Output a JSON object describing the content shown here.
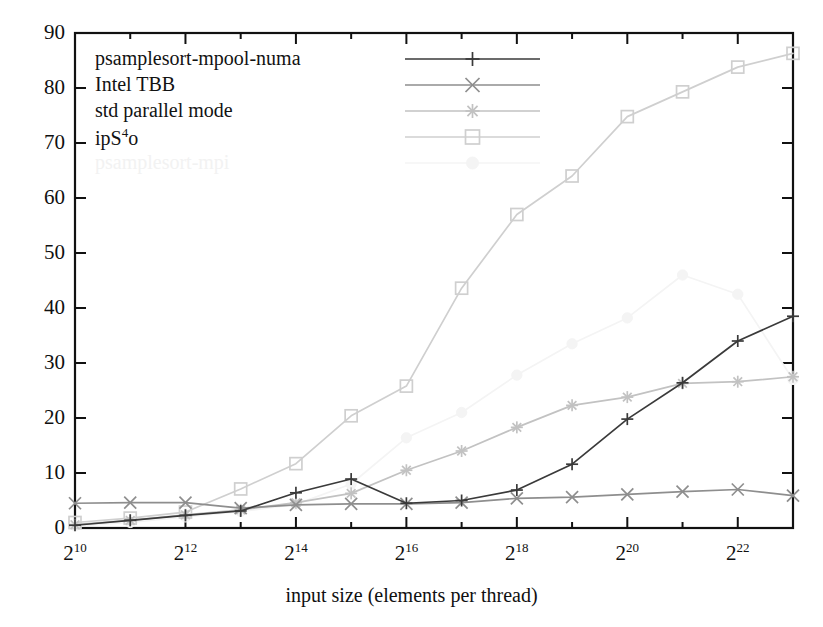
{
  "chart_data": {
    "type": "line",
    "title": "",
    "xlabel": "input size (elements per thread)",
    "ylabel": "",
    "x_tick_labels": [
      "2^10",
      "2^12",
      "2^14",
      "2^16",
      "2^18",
      "2^20",
      "2^22"
    ],
    "x_exponents": [
      10,
      11,
      12,
      13,
      14,
      15,
      16,
      17,
      18,
      19,
      20,
      21,
      22,
      23
    ],
    "x_labeled_exponents": [
      10,
      12,
      14,
      16,
      18,
      20,
      22
    ],
    "xlim_exponents": [
      10,
      23
    ],
    "y_ticks": [
      0,
      10,
      20,
      30,
      40,
      50,
      60,
      70,
      80,
      90
    ],
    "ylim": [
      0,
      90
    ],
    "grid": false,
    "legend_position": "top-left-inside",
    "series": [
      {
        "name": "psamplesort-mpool-numa",
        "marker": "plus",
        "color": "#3a3a3a",
        "x": [
          10,
          11,
          12,
          13,
          14,
          15,
          16,
          17,
          18,
          19,
          20,
          21,
          22,
          23
        ],
        "values": [
          0.5,
          1.4,
          2.3,
          3.1,
          6.4,
          8.9,
          4.5,
          5.0,
          6.9,
          11.6,
          19.8,
          26.4,
          34.0,
          38.5
        ]
      },
      {
        "name": "Intel TBB",
        "marker": "cross",
        "color": "#8e8e8e",
        "x": [
          10,
          11,
          12,
          13,
          14,
          15,
          16,
          17,
          18,
          19,
          20,
          21,
          22,
          23
        ],
        "values": [
          4.5,
          4.6,
          4.6,
          3.6,
          4.2,
          4.4,
          4.4,
          4.6,
          5.4,
          5.6,
          6.1,
          6.6,
          7.0,
          5.9
        ]
      },
      {
        "name": "std parallel mode",
        "marker": "asterisk",
        "color": "#c2c2c2",
        "x": [
          10,
          11,
          12,
          13,
          14,
          15,
          16,
          17,
          18,
          19,
          20,
          21,
          22,
          23
        ],
        "values": [
          0.6,
          1.4,
          2.4,
          3.3,
          4.6,
          6.3,
          10.5,
          14.0,
          18.3,
          22.3,
          23.8,
          26.3,
          26.6,
          27.5
        ]
      },
      {
        "name": "ipS^4o",
        "marker": "square",
        "color": "#cfcfcf",
        "x": [
          10,
          11,
          12,
          13,
          14,
          15,
          16,
          17,
          18,
          19,
          20,
          21,
          22,
          23
        ],
        "values": [
          1.0,
          1.8,
          2.9,
          7.1,
          11.7,
          20.4,
          25.8,
          43.6,
          57.0,
          64.0,
          74.8,
          79.3,
          83.8,
          86.3
        ]
      },
      {
        "name": "psamplesort-mpi",
        "marker": "filled-circle",
        "color": "#f4f4f4",
        "x": [
          10,
          11,
          12,
          13,
          14,
          15,
          16,
          17,
          18,
          19,
          20,
          21,
          22,
          23
        ],
        "values": [
          0.4,
          1.0,
          2.0,
          3.0,
          4.3,
          8.0,
          16.4,
          21.0,
          27.8,
          33.5,
          38.2,
          46.0,
          42.5,
          27.0
        ]
      }
    ]
  },
  "legend": {
    "items": [
      {
        "label": "psamplesort-mpool-numa"
      },
      {
        "label": "Intel TBB"
      },
      {
        "label": "std parallel mode"
      },
      {
        "label_base": "ipS",
        "label_sup": "4",
        "label_tail": "o"
      },
      {
        "label": "psamplesort-mpi"
      }
    ]
  },
  "axis": {
    "x_title": "input size (elements per thread)"
  }
}
